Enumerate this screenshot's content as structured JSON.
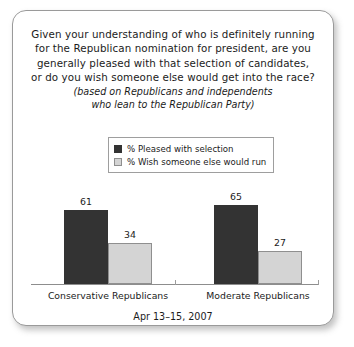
{
  "card": {
    "title_lines": [
      "Given your understanding of who is definitely running",
      "for the Republican nomination for president, are you",
      "generally pleased with that selection of candidates,",
      "or do you wish someone else would get into the race?"
    ],
    "subtitle_lines": [
      "(based on Republicans and independents",
      "who lean to the Republican Party)"
    ],
    "footer": "Apr 13–15, 2007"
  },
  "legend": {
    "items": [
      {
        "label": "% Pleased with selection",
        "color": "#333333"
      },
      {
        "label": "% Wish someone else would run",
        "color": "#d4d4d4"
      }
    ]
  },
  "chart_data": {
    "type": "bar",
    "subtitle": "(based on Republicans and independents who lean to the Republican Party)",
    "categories": [
      "Conservative Republicans",
      "Moderate Republicans"
    ],
    "series": [
      {
        "name": "% Pleased with selection",
        "color": "#333333",
        "values": [
          61,
          65
        ]
      },
      {
        "name": "% Wish someone else would run",
        "color": "#d4d4d4",
        "values": [
          34,
          27
        ]
      }
    ],
    "xlabel": "",
    "ylabel": "",
    "ylim": [
      0,
      100
    ],
    "grid": false,
    "legend_position": "top-center",
    "value_labels": true,
    "footnote": "Apr 13–15, 2007"
  }
}
